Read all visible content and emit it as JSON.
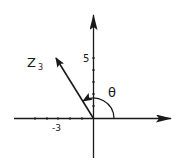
{
  "diagram": {
    "type": "argand-plane",
    "vector": {
      "name": "Z",
      "subscript": "3",
      "x": -3,
      "y": 5
    },
    "angle_label": "θ",
    "axis_labels": {
      "x_tick_label": "-3",
      "y_tick_label": "5"
    },
    "colors": {
      "ink": "#1a1a1a",
      "background": "#ffffff"
    }
  }
}
